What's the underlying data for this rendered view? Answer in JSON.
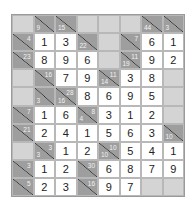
{
  "puzzle": {
    "type": "kakuro",
    "cols": 8,
    "rows": 10,
    "grid": [
      [
        {
          "t": "b"
        },
        {
          "t": "c",
          "d": "9"
        },
        {
          "t": "c",
          "d": "15"
        },
        {
          "t": "b"
        },
        {
          "t": "b"
        },
        {
          "t": "b"
        },
        {
          "t": "c",
          "d": "44"
        },
        {
          "t": "c",
          "d": "3"
        }
      ],
      [
        {
          "t": "c",
          "r": "4"
        },
        {
          "t": "v",
          "v": "1"
        },
        {
          "t": "v",
          "v": "3"
        },
        {
          "t": "c",
          "d": "22"
        },
        {
          "t": "b"
        },
        {
          "t": "c",
          "r": "7"
        },
        {
          "t": "v",
          "v": "6"
        },
        {
          "t": "v",
          "v": "1"
        }
      ],
      [
        {
          "t": "c",
          "r": "23"
        },
        {
          "t": "v",
          "v": "8"
        },
        {
          "t": "v",
          "v": "9"
        },
        {
          "t": "v",
          "v": "6"
        },
        {
          "t": "b"
        },
        {
          "t": "c",
          "r": "11",
          "d": "19"
        },
        {
          "t": "v",
          "v": "9"
        },
        {
          "t": "v",
          "v": "2"
        }
      ],
      [
        {
          "t": "b"
        },
        {
          "t": "c",
          "r": "16"
        },
        {
          "t": "v",
          "v": "7"
        },
        {
          "t": "v",
          "v": "9"
        },
        {
          "t": "c",
          "r": "11",
          "d": "14"
        },
        {
          "t": "v",
          "v": "3"
        },
        {
          "t": "v",
          "v": "8"
        },
        {
          "t": "b"
        }
      ],
      [
        {
          "t": "b"
        },
        {
          "t": "c",
          "d": "3"
        },
        {
          "t": "c",
          "r": "28",
          "d": "16"
        },
        {
          "t": "v",
          "v": "8"
        },
        {
          "t": "v",
          "v": "6"
        },
        {
          "t": "v",
          "v": "9"
        },
        {
          "t": "v",
          "v": "5"
        },
        {
          "t": "b"
        }
      ],
      [
        {
          "t": "c",
          "r": "7"
        },
        {
          "t": "v",
          "v": "1"
        },
        {
          "t": "v",
          "v": "6"
        },
        {
          "t": "c",
          "r": "8",
          "d": "4"
        },
        {
          "t": "v",
          "v": "3"
        },
        {
          "t": "v",
          "v": "1"
        },
        {
          "t": "v",
          "v": "2"
        },
        {
          "t": "b"
        }
      ],
      [
        {
          "t": "c",
          "r": "21"
        },
        {
          "t": "v",
          "v": "2"
        },
        {
          "t": "v",
          "v": "4"
        },
        {
          "t": "v",
          "v": "1"
        },
        {
          "t": "v",
          "v": "5"
        },
        {
          "t": "v",
          "v": "6"
        },
        {
          "t": "v",
          "v": "3"
        },
        {
          "t": "c",
          "d": "10"
        }
      ],
      [
        {
          "t": "b"
        },
        {
          "t": "c",
          "r": "3",
          "d": "3"
        },
        {
          "t": "v",
          "v": "1"
        },
        {
          "t": "v",
          "v": "2"
        },
        {
          "t": "c",
          "r": "10",
          "d": "10"
        },
        {
          "t": "v",
          "v": "5"
        },
        {
          "t": "v",
          "v": "4"
        },
        {
          "t": "v",
          "v": "1"
        }
      ],
      [
        {
          "t": "c",
          "r": "3"
        },
        {
          "t": "v",
          "v": "1"
        },
        {
          "t": "v",
          "v": "2"
        },
        {
          "t": "c",
          "r": "30"
        },
        {
          "t": "v",
          "v": "6"
        },
        {
          "t": "v",
          "v": "8"
        },
        {
          "t": "v",
          "v": "7"
        },
        {
          "t": "v",
          "v": "9"
        }
      ],
      [
        {
          "t": "c",
          "r": "5"
        },
        {
          "t": "v",
          "v": "2"
        },
        {
          "t": "v",
          "v": "3"
        },
        {
          "t": "c",
          "r": "16"
        },
        {
          "t": "v",
          "v": "9"
        },
        {
          "t": "v",
          "v": "7"
        },
        {
          "t": "b"
        },
        {
          "t": "b"
        }
      ]
    ]
  }
}
